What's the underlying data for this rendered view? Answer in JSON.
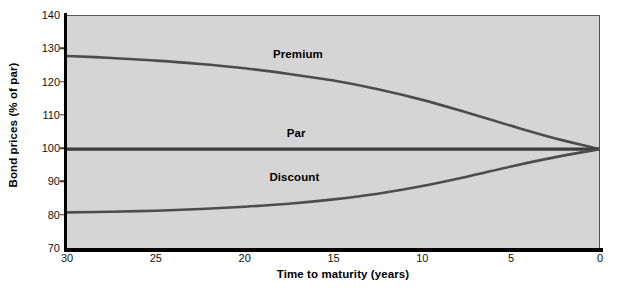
{
  "chart_data": {
    "type": "line",
    "title": "",
    "xlabel": "Time to maturity (years)",
    "ylabel": "Bond prices (% of par)",
    "xlim": [
      30,
      0
    ],
    "ylim": [
      70,
      140
    ],
    "x_ticks": [
      30,
      25,
      20,
      15,
      10,
      5,
      0
    ],
    "x_tick_labels": [
      "30",
      "25",
      "20",
      "15",
      "10",
      "5",
      "0"
    ],
    "y_ticks": [
      70,
      80,
      90,
      100,
      110,
      120,
      130,
      140
    ],
    "y_tick_labels": [
      "70",
      "80",
      "90",
      "100",
      "110",
      "120",
      "130",
      "140"
    ],
    "x_axis_reversed": true,
    "grid": false,
    "legend": "inline-annotations",
    "plot_background": "#d5d5d5",
    "curve_color": "#4d4d4d",
    "par_color": "#3c3c3c",
    "x": [
      30,
      27.5,
      25,
      22.5,
      20,
      17.5,
      15,
      12.5,
      10,
      7.5,
      5,
      2.5,
      0
    ],
    "series": [
      {
        "name": "Premium",
        "label": "Premium",
        "values": [
          128.0,
          127.4,
          126.6,
          125.6,
          124.3,
          122.6,
          120.6,
          118.0,
          114.8,
          111.0,
          107.0,
          103.2,
          100.0
        ],
        "label_x": 17.0,
        "label_y": 128.5
      },
      {
        "name": "Par",
        "label": "Par",
        "values": [
          100.0,
          100.0,
          100.0,
          100.0,
          100.0,
          100.0,
          100.0,
          100.0,
          100.0,
          100.0,
          100.0,
          100.0,
          100.0
        ],
        "label_x": 17.1,
        "label_y": 105.0
      },
      {
        "name": "Discount",
        "label": "Discount",
        "values": [
          81.0,
          81.2,
          81.5,
          82.0,
          82.7,
          83.6,
          84.9,
          86.6,
          88.9,
          91.7,
          94.8,
          97.6,
          100.0
        ],
        "label_x": 17.2,
        "label_y": 91.5
      }
    ]
  }
}
